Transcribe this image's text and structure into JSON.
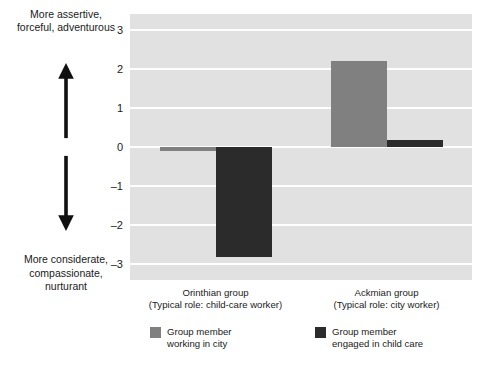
{
  "axis_annotation": {
    "top_lines": [
      "More",
      "assertive,",
      "forceful,",
      "adventurous"
    ],
    "bottom_lines": [
      "More",
      "considerate,",
      "compassionate,",
      "nurturant"
    ],
    "arrow_icon": "double-headed-vertical-arrow-icon"
  },
  "legend": {
    "items": [
      {
        "name": "Group member working in city",
        "lines": [
          "Group member",
          "working in city"
        ],
        "color": "#808080"
      },
      {
        "name": "Group member engaged in child care",
        "lines": [
          "Group member",
          "engaged in child care"
        ],
        "color": "#2b2b2b"
      }
    ]
  },
  "categories_detail": [
    {
      "lines": [
        "Orinthian group",
        "(Typical role: child-care worker)"
      ]
    },
    {
      "lines": [
        "Ackmian group",
        "(Typical role: city worker)"
      ]
    }
  ],
  "caption": {
    "text": ""
  },
  "chart_data": {
    "type": "bar",
    "title": "",
    "xlabel": "",
    "ylabel": "",
    "categories": [
      "Orinthian group (Typical role: child-care worker)",
      "Ackmian group (Typical role: city worker)"
    ],
    "series": [
      {
        "name": "Group member working in city",
        "color": "#808080",
        "values": [
          -0.1,
          2.2
        ]
      },
      {
        "name": "Group member engaged in child care",
        "color": "#2b2b2b",
        "values": [
          -2.8,
          0.17
        ]
      }
    ],
    "ylim": [
      -3.4,
      3.4
    ],
    "yticks": [
      3,
      2,
      1,
      0,
      -1,
      -2,
      -3
    ],
    "ytick_labels": [
      "3",
      "2",
      "1",
      "0",
      "–1",
      "–2",
      "–3"
    ],
    "grid": true,
    "grid_color": "#ffffff",
    "plot_background": "#e1e1e1",
    "legend_position": "bottom",
    "zero_line": 0
  }
}
